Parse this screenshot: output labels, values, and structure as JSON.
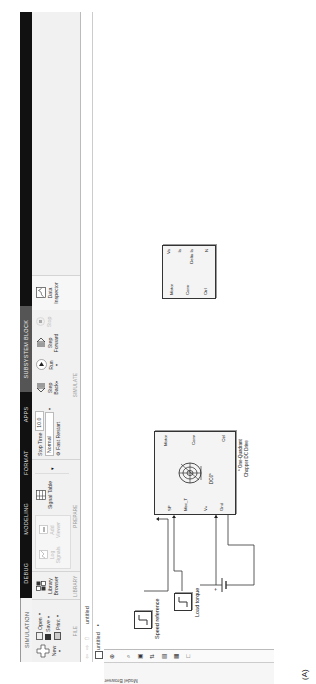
{
  "tabs": [
    "SIMULATION",
    "DEBUG",
    "MODELING",
    "FORMAT",
    "APPS",
    "SUBSYSTEM BLOCK"
  ],
  "file_group": {
    "name": "FILE",
    "new_label": "New",
    "open_label": "Open",
    "save_label": "Save",
    "print_label": "Print"
  },
  "library_group": {
    "name": "LIBRARY",
    "library_browser_label": "Library Browser"
  },
  "prepare_group": {
    "name": "PREPARE",
    "log_signals_label": "Log Signals",
    "add_viewer_label": "Add Viewer",
    "signal_table_label": "Signal Table"
  },
  "simulate_group": {
    "name": "SIMULATE",
    "stop_time_label": "Stop Time",
    "stop_time_value": "10.0",
    "mode_value": "Normal",
    "fast_restart_label": "Fast Restart",
    "step_back_label": "Step Back",
    "run_label": "Run",
    "step_forward_label": "Step Forward",
    "stop_label": "Stop"
  },
  "review_group": {
    "data_inspector_label": "Data Inspector"
  },
  "address_bar": {
    "model_name": "untitled"
  },
  "breadcrumb": {
    "model_name": "untitled"
  },
  "model_browser_label": "Model Browser",
  "diagram": {
    "speed_reference_label": "Speed reference",
    "load_torque_label": "Load torque",
    "battery_plus": "+",
    "drive_block": {
      "inputs": [
        "SP",
        "Mec_T",
        "V+",
        "Gnd"
      ],
      "outputs": [
        "Motor",
        "Conv",
        "Ctrl"
      ],
      "center_label": "DC6*",
      "caption_line1": "* One-Quadrant",
      "caption_line2": "Chopper DC Drive"
    },
    "demux_block": {
      "inputs": [
        "Motor",
        "Conv",
        "Ctrl"
      ],
      "outputs": [
        "Va",
        "Ia",
        "Duty",
        "Delta Ia",
        "N"
      ]
    }
  },
  "figure_caption": "(A)"
}
